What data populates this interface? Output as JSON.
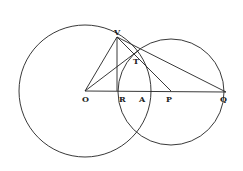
{
  "diagram": {
    "type": "geometry",
    "labels": {
      "O": "O",
      "V": "V",
      "T": "T",
      "R": "R",
      "A": "A",
      "P": "P",
      "Q": "Q"
    },
    "points": {
      "O": [
        85,
        91
      ],
      "V": [
        117,
        37
      ],
      "T": [
        137,
        51
      ],
      "R": [
        117,
        91
      ],
      "A": [
        151,
        91
      ],
      "P": [
        171,
        91
      ],
      "Q": [
        226,
        92
      ]
    },
    "circles": [
      {
        "name": "circle-centered-O",
        "center": "O",
        "cx": 85,
        "cy": 91,
        "r": 66
      },
      {
        "name": "circle-centered-P",
        "center": "P",
        "cx": 171,
        "cy": 92,
        "r": 55
      }
    ],
    "segments": [
      [
        "O",
        "Q"
      ],
      [
        "O",
        "V"
      ],
      [
        "V",
        "R"
      ],
      [
        "V",
        "Q"
      ],
      [
        "V",
        "P"
      ],
      [
        "O",
        "T"
      ]
    ],
    "colors": {
      "stroke": "#222222",
      "background": "#ffffff"
    }
  }
}
